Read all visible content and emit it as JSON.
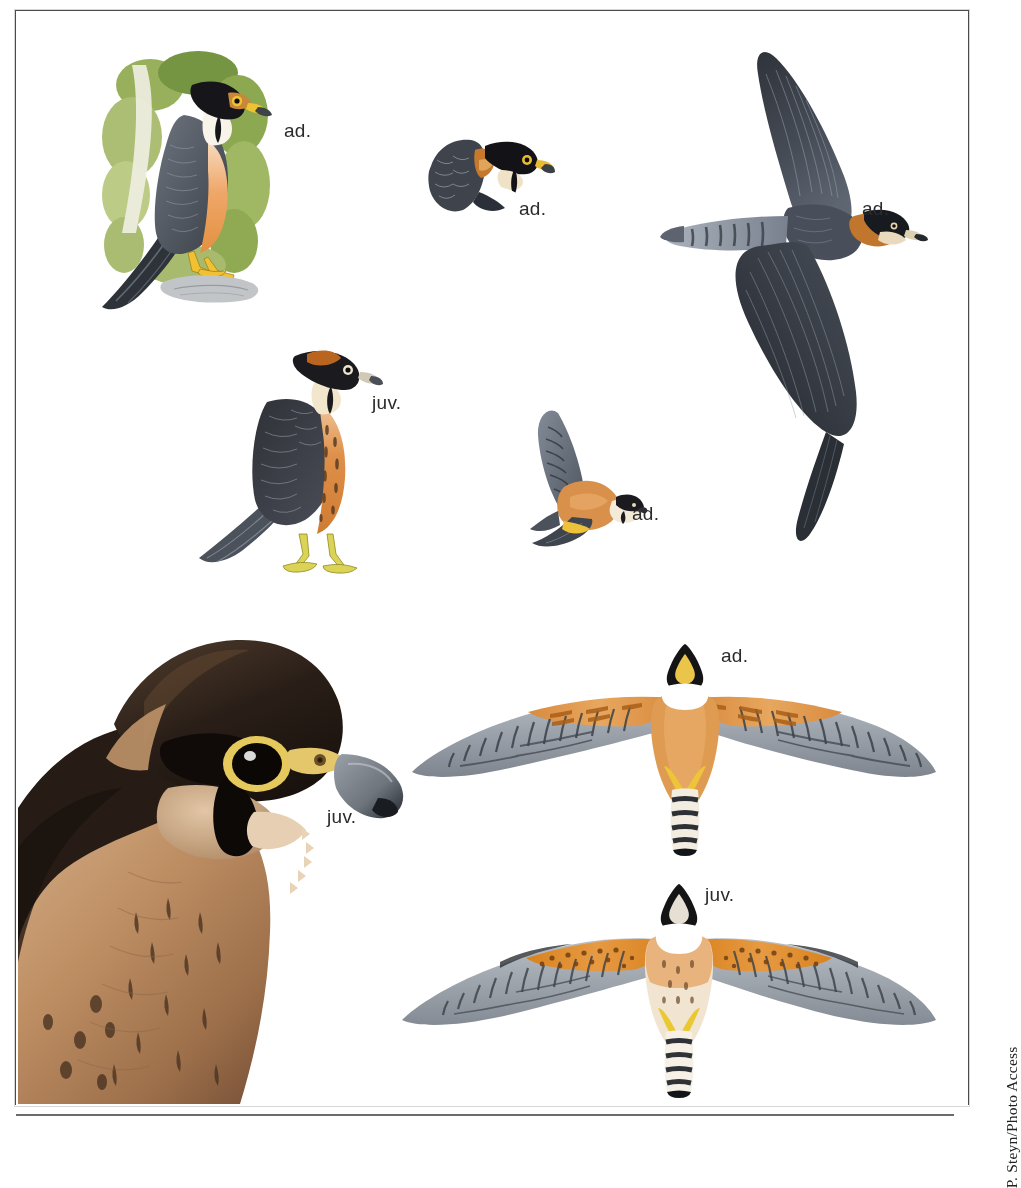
{
  "page": {
    "kind": "field-guide-plate",
    "background": "#ffffff",
    "frame_color": "#4a4a4a",
    "width": 1005,
    "height": 1123
  },
  "credit": {
    "text": "P. Steyn/Photo Access",
    "orientation": "vertical-bottom-to-top",
    "color": "#222222"
  },
  "labels": [
    {
      "id": "perched-adult",
      "text": "ad.",
      "x": 284,
      "y": 120
    },
    {
      "id": "head-adult",
      "text": "ad.",
      "x": 519,
      "y": 198
    },
    {
      "id": "flight-upper-adult",
      "text": "ad.",
      "x": 862,
      "y": 198
    },
    {
      "id": "perched-juvenile",
      "text": "juv.",
      "x": 372,
      "y": 392
    },
    {
      "id": "flight-side-adult",
      "text": "ad.",
      "x": 632,
      "y": 503
    },
    {
      "id": "underside-adult",
      "text": "ad.",
      "x": 721,
      "y": 645
    },
    {
      "id": "photo-juvenile",
      "text": "juv.",
      "x": 327,
      "y": 806
    },
    {
      "id": "underside-juvenile",
      "text": "juv.",
      "x": 705,
      "y": 884
    }
  ],
  "figures": [
    {
      "id": "perched-adult-illustration",
      "name": "perched adult falcon on rock with foliage",
      "type": "illustration",
      "x": 88,
      "y": 45,
      "w": 190,
      "h": 270,
      "colors": {
        "foliage": "#8aa44a",
        "foliage_dark": "#5d7b2e",
        "upperparts": "#58606a",
        "upperparts_dark": "#2d3239",
        "hood": "#1b1b1b",
        "cheek": "#f6f1e6",
        "breast": "#efa76a",
        "cere_eyering": "#f2c233",
        "feet": "#f2c233",
        "rock": "#b9bcc0"
      }
    },
    {
      "id": "head-adult-illustration",
      "name": "adult head portrait",
      "type": "illustration",
      "x": 423,
      "y": 130,
      "w": 130,
      "h": 85,
      "colors": {
        "crown": "#141414",
        "nape_patch": "#c97a2a",
        "mantle": "#4b535c",
        "throat": "#ffffff",
        "eyering": "#e8bb33",
        "bill": "#3c4148"
      }
    },
    {
      "id": "flight-upper-adult-illustration",
      "name": "adult in flight from above",
      "type": "illustration",
      "x": 640,
      "y": 40,
      "w": 300,
      "h": 540,
      "colors": {
        "wing_dark": "#3b3f48",
        "wing_mid": "#575e69",
        "wing_pale": "#8b95a3",
        "tail_barring": "#9aa3ae",
        "nape": "#c0762c",
        "hood": "#171717",
        "cheek": "#e9d9bd"
      }
    },
    {
      "id": "perched-juvenile-illustration",
      "name": "perched juvenile falcon",
      "type": "illustration",
      "x": 195,
      "y": 330,
      "w": 200,
      "h": 260,
      "colors": {
        "upperparts": "#3a3b42",
        "upper_fringe": "#7f8894",
        "hood": "#1b1b1b",
        "nape_patch": "#b9651f",
        "underparts": "#d98a43",
        "streaks": "#4a3321",
        "feet": "#d8d24a",
        "tail": "#5c626c"
      }
    },
    {
      "id": "flight-side-adult-illustration",
      "name": "adult in flight banking, side view",
      "type": "illustration",
      "x": 520,
      "y": 405,
      "w": 125,
      "h": 150,
      "colors": {
        "wing": "#6d7681",
        "wing_bar": "#33383f",
        "body": "#d9904b",
        "vent": "#edc23a",
        "hood": "#1b1b1b",
        "cheek": "#f3ead8"
      }
    },
    {
      "id": "photo-juvenile",
      "name": "juvenile falcon head photograph",
      "type": "photograph",
      "x": 18,
      "y": 612,
      "w": 400,
      "h": 491,
      "colors": {
        "crown": "#2a1f19",
        "crown_hi": "#5a4433",
        "mask": "#120d0a",
        "cheek": "#c9a480",
        "breast": "#c29166",
        "breast_dark": "#8d6441",
        "eyering": "#e2c658",
        "eye": "#0b0705",
        "bill": "#7d848c",
        "bill_tip": "#20242a"
      }
    },
    {
      "id": "underside-adult-illustration",
      "name": "adult in flight from below, spread wings",
      "type": "illustration",
      "x": 400,
      "y": 645,
      "w": 540,
      "h": 215,
      "colors": {
        "body": "#e09a4e",
        "coverts": "#e3a45c",
        "flight_feathers": "#8d929a",
        "barring": "#3c4148",
        "throat": "#ffffff",
        "hood": "#141414",
        "vent": "#edc43a",
        "tail_bars": "#23272c"
      }
    },
    {
      "id": "underside-juvenile-illustration",
      "name": "juvenile in flight from below, spread wings",
      "type": "illustration",
      "x": 392,
      "y": 880,
      "w": 550,
      "h": 215,
      "colors": {
        "body": "#f0e2cf",
        "coverts": "#e08b36",
        "flight_feathers": "#949aa2",
        "barring": "#41464d",
        "throat": "#ffffff",
        "hood": "#141414",
        "vent": "#e9c832",
        "streaks": "#6b4a2c"
      }
    }
  ]
}
